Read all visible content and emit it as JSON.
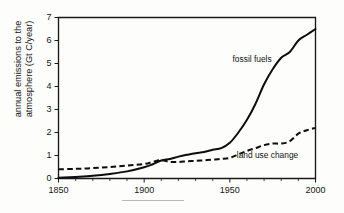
{
  "chart_data": {
    "type": "line",
    "title": "",
    "xlabel": "",
    "ylabel": "annual emissions to the atmosphere (Gt C/year)",
    "ylabel_line1": "annual emissions to the",
    "ylabel_line2": "atmosphere (Gt C/year)",
    "xlim": [
      1850,
      2000
    ],
    "ylim": [
      0,
      7
    ],
    "xticks": [
      1850,
      1900,
      1950,
      2000
    ],
    "xtick_labels": [
      "1850",
      "1900",
      "1950",
      "2000"
    ],
    "xminor_step": 10,
    "yticks": [
      0,
      1,
      2,
      3,
      4,
      5,
      6,
      7
    ],
    "ytick_labels": [
      "0",
      "1",
      "2",
      "3",
      "4",
      "5",
      "6",
      "7"
    ],
    "grid": false,
    "legend": "inline-annotations",
    "series": [
      {
        "name": "fossil fuels",
        "style": "solid",
        "color": "#0d0d0d",
        "label_x": 1963,
        "label_y": 5.05,
        "x": [
          1850,
          1860,
          1870,
          1880,
          1890,
          1900,
          1905,
          1910,
          1915,
          1920,
          1925,
          1930,
          1935,
          1940,
          1945,
          1950,
          1955,
          1960,
          1965,
          1970,
          1975,
          1980,
          1985,
          1990,
          1995,
          2000
        ],
        "y": [
          0.03,
          0.07,
          0.12,
          0.2,
          0.31,
          0.49,
          0.62,
          0.78,
          0.85,
          0.95,
          1.03,
          1.1,
          1.15,
          1.25,
          1.32,
          1.55,
          2.0,
          2.55,
          3.25,
          4.1,
          4.75,
          5.25,
          5.5,
          6.0,
          6.25,
          6.5
        ]
      },
      {
        "name": "land use change",
        "style": "dashed",
        "color": "#0d0d0d",
        "label_x": 1972,
        "label_y": 0.88,
        "x": [
          1850,
          1860,
          1870,
          1880,
          1890,
          1900,
          1905,
          1910,
          1915,
          1920,
          1925,
          1930,
          1935,
          1940,
          1945,
          1950,
          1955,
          1960,
          1965,
          1970,
          1975,
          1980,
          1985,
          1990,
          1995,
          2000
        ],
        "y": [
          0.4,
          0.42,
          0.45,
          0.5,
          0.56,
          0.63,
          0.72,
          0.8,
          0.72,
          0.72,
          0.75,
          0.77,
          0.79,
          0.82,
          0.85,
          0.9,
          1.05,
          1.2,
          1.32,
          1.45,
          1.52,
          1.52,
          1.62,
          1.95,
          2.1,
          2.2
        ]
      }
    ]
  },
  "annotations": {
    "fossil_fuels_label": "fossil fuels",
    "land_use_label": "land use change"
  }
}
